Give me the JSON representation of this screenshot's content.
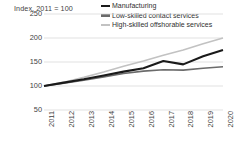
{
  "chart_data": {
    "type": "line",
    "title": "Index, 2011 = 100",
    "xlabel": "",
    "ylabel": "",
    "x": [
      2011,
      2012,
      2013,
      2014,
      2015,
      2016,
      2017,
      2018,
      2019,
      2020
    ],
    "categories": [
      "2011",
      "2012",
      "2013",
      "2014",
      "2015",
      "2016",
      "2017",
      "2018",
      "2019",
      "2020"
    ],
    "ylim": [
      50,
      250
    ],
    "yticks": [
      250,
      200,
      150,
      100,
      50
    ],
    "ytick_labels": [
      "250",
      "200",
      "150",
      "100",
      "50"
    ],
    "grid": true,
    "legend_position": "top-right",
    "series": [
      {
        "name": "Manufacturing",
        "color": "#1a1a1a",
        "width": 2.1,
        "values": [
          100,
          107,
          114,
          122,
          130,
          137,
          152,
          145,
          162,
          175
        ]
      },
      {
        "name": "Low-skilled contact services",
        "color": "#6b6b6b",
        "width": 1.6,
        "values": [
          100,
          106,
          112,
          119,
          126,
          131,
          134,
          133,
          137,
          140
        ]
      },
      {
        "name": "High-skilled offshorable services",
        "color": "#c2c2c2",
        "width": 1.6,
        "values": [
          100,
          108,
          118,
          129,
          141,
          152,
          164,
          175,
          188,
          200
        ]
      }
    ]
  },
  "legend": {
    "items": [
      {
        "label": "Manufacturing",
        "color": "#1a1a1a",
        "weight": "thick"
      },
      {
        "label": "Low-skilled contact services",
        "color": "#6b6b6b",
        "weight": "thick"
      },
      {
        "label": "High-skilled offshorable services",
        "color": "#c2c2c2",
        "weight": "thin"
      }
    ]
  },
  "colors": {
    "gridline": "#d9d9d9",
    "text": "#3f3f3f",
    "background": "#ffffff"
  }
}
